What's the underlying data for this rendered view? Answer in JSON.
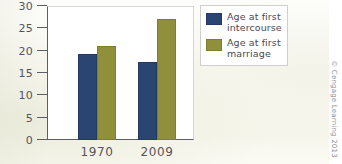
{
  "chart_data": {
    "type": "bar",
    "title": "",
    "subtitle": "",
    "xlabel": "",
    "ylabel": "",
    "categories": [
      "1970",
      "2009"
    ],
    "series": [
      {
        "name": "Age at first intercourse",
        "color": "#2b4573",
        "values": [
          19.3,
          17.5
        ]
      },
      {
        "name": "Age at first marriage",
        "color": "#8f8f3c",
        "values": [
          21.0,
          27.0
        ]
      }
    ],
    "ylim": [
      0,
      30
    ],
    "yticks": [
      0,
      5,
      10,
      15,
      20,
      25,
      30
    ],
    "ytick_labels": [
      "0",
      "5",
      "10",
      "15",
      "20",
      "25",
      "30"
    ],
    "grid": false,
    "legend_position": "upper-right",
    "annotations": [
      "© Cengage Learning 2013"
    ]
  },
  "legend": {
    "entries": [
      {
        "label_line1": "Age at first",
        "label_line2": "intercourse"
      },
      {
        "label_line1": "Age at first",
        "label_line2": "marriage"
      }
    ]
  },
  "credit": {
    "text": "© Cengage Learning 2013"
  },
  "colors": {
    "series_0": "#2b4573",
    "series_1": "#8f8f3c",
    "axis": "#5d5d66",
    "text": "#54545e",
    "plot_background": "#ffffff",
    "page_background": "#fbfbf6"
  }
}
